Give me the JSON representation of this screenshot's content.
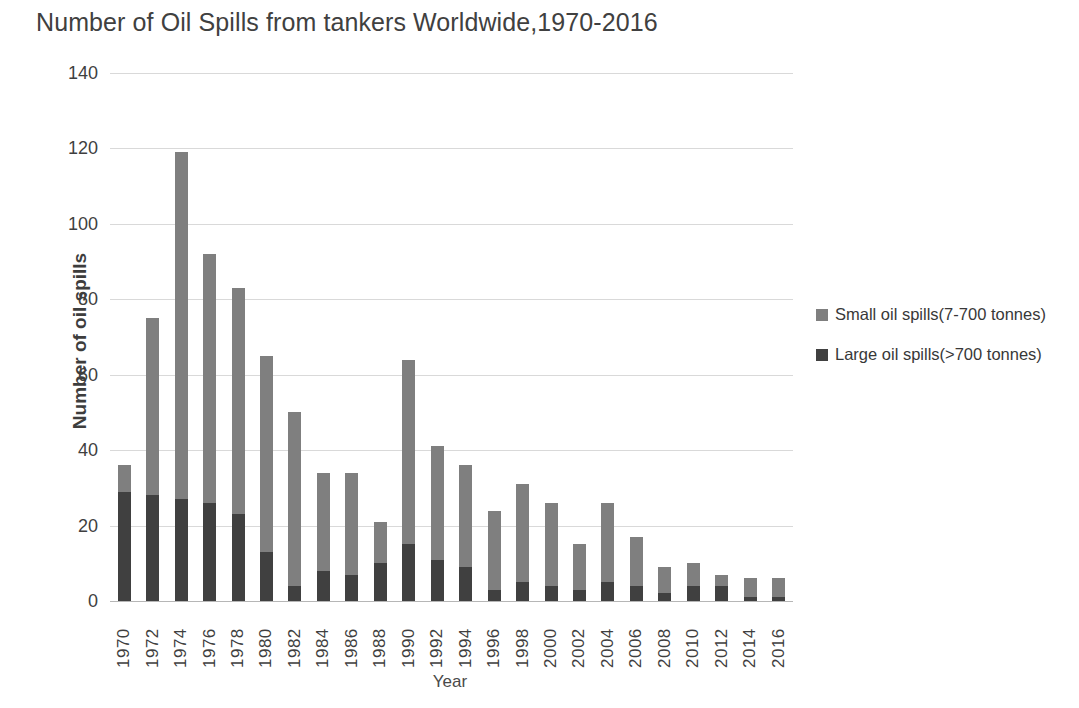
{
  "chart_data": {
    "type": "bar",
    "subtype": "stacked-vertical",
    "title": "Number of Oil Spills from tankers Worldwide,1970-2016",
    "xlabel": "Year",
    "ylabel": "Number of oil spills",
    "ylim": [
      0,
      140
    ],
    "yticks": [
      0,
      20,
      40,
      60,
      80,
      100,
      120,
      140
    ],
    "grid": true,
    "legend_position": "right",
    "categories": [
      "1970",
      "1972",
      "1974",
      "1976",
      "1978",
      "1980",
      "1982",
      "1984",
      "1986",
      "1988",
      "1990",
      "1992",
      "1994",
      "1996",
      "1998",
      "2000",
      "2002",
      "2004",
      "2006",
      "2008",
      "2010",
      "2012",
      "2014",
      "2016"
    ],
    "series": [
      {
        "name": "Large oil spills(>700 tonnes)",
        "color": "#404040",
        "values": [
          29,
          28,
          27,
          26,
          23,
          13,
          4,
          8,
          7,
          10,
          15,
          11,
          9,
          3,
          5,
          4,
          3,
          5,
          4,
          2,
          4,
          4,
          1,
          1
        ]
      },
      {
        "name": "Small oil spills(7-700 tonnes)",
        "color": "#7f7f7f",
        "values": [
          7,
          47,
          92,
          66,
          60,
          52,
          46,
          26,
          27,
          11,
          49,
          30,
          27,
          21,
          26,
          22,
          12,
          21,
          13,
          7,
          6,
          3,
          5,
          5
        ]
      }
    ],
    "totals": [
      36,
      75,
      119,
      92,
      83,
      65,
      50,
      34,
      34,
      21,
      64,
      41,
      36,
      24,
      31,
      26,
      15,
      26,
      17,
      9,
      10,
      7,
      6,
      6
    ]
  },
  "legend": {
    "items": [
      {
        "label": "Small oil spills(7-700 tonnes)",
        "color": "#7f7f7f"
      },
      {
        "label": "Large oil spills(>700 tonnes)",
        "color": "#404040"
      }
    ]
  }
}
